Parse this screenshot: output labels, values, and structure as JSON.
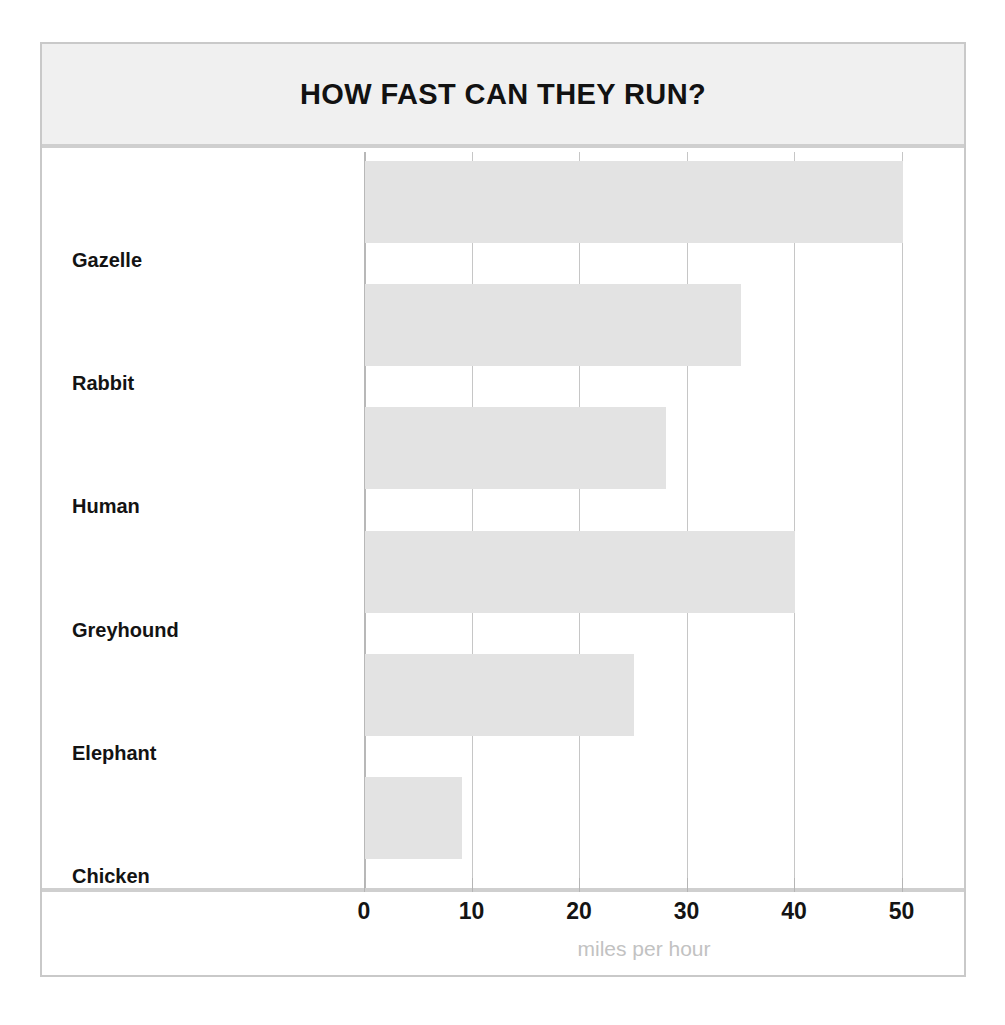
{
  "chart_data": {
    "type": "bar",
    "orientation": "horizontal",
    "title": "HOW FAST CAN THEY RUN?",
    "categories": [
      "Gazelle",
      "Rabbit",
      "Human",
      "Greyhound",
      "Elephant",
      "Chicken"
    ],
    "values": [
      50,
      35,
      28,
      40,
      25,
      9
    ],
    "xlabel": "miles per hour",
    "ylabel": "",
    "xlim": [
      0,
      55
    ],
    "xticks": [
      0,
      10,
      20,
      30,
      40,
      50
    ],
    "xtick_labels": [
      "0",
      "10",
      "20",
      "30",
      "40",
      "50"
    ],
    "grid": "vertical",
    "legend": "none",
    "bar_color": "#e3e3e3",
    "gridline_color": "#c6c6c6",
    "title_color": "#121212",
    "axis_label_color": "#c2c2c2",
    "band_color": "#f0f0f0",
    "frame_color": "#c9c9c9"
  }
}
